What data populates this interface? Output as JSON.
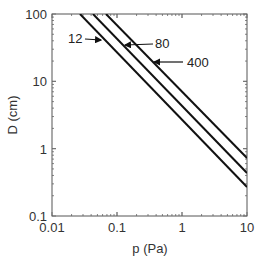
{
  "chart_data": {
    "type": "line",
    "title": "",
    "xlabel": "p (Pa)",
    "ylabel": "D (cm)",
    "xscale": "log",
    "yscale": "log",
    "xlim": [
      0.01,
      10
    ],
    "ylim": [
      0.1,
      100
    ],
    "x_ticks": [
      "0.01",
      "0.1",
      "1",
      "10"
    ],
    "y_ticks": [
      "0.1",
      "1",
      "10",
      "100"
    ],
    "grid": false,
    "legend": "inline annotations with arrows",
    "series": [
      {
        "name": "12",
        "points": [
          [
            0.027,
            100
          ],
          [
            10,
            0.27
          ]
        ]
      },
      {
        "name": "80",
        "points": [
          [
            0.043,
            100
          ],
          [
            10,
            0.43
          ]
        ]
      },
      {
        "name": "400",
        "points": [
          [
            0.068,
            100
          ],
          [
            10,
            0.72
          ]
        ]
      }
    ],
    "annotations": [
      {
        "text": "12",
        "target_series": "12"
      },
      {
        "text": "80",
        "target_series": "80"
      },
      {
        "text": "400",
        "target_series": "400"
      }
    ]
  },
  "labels": {
    "x_axis": "p (Pa)",
    "y_axis": "D (cm)",
    "x_ticks": [
      "0.01",
      "0.1",
      "1",
      "10"
    ],
    "y_ticks": [
      "0.1",
      "1",
      "10",
      "100"
    ],
    "anno_12": "12",
    "anno_80": "80",
    "anno_400": "400"
  },
  "colors": {
    "line": "#111111",
    "axis": "#555555",
    "text": "#333333"
  }
}
